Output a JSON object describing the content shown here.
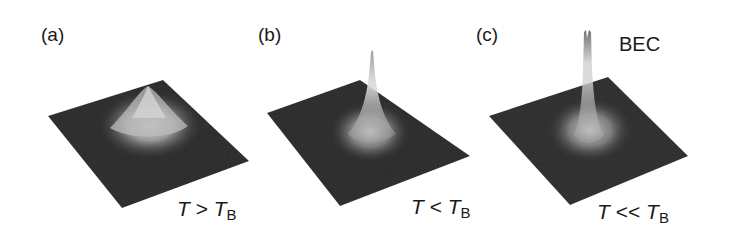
{
  "figure": {
    "panels": [
      {
        "label": "(a)",
        "condition": {
          "lhs": "T",
          "op": ">",
          "rhs": "T",
          "rhs_sub": "B"
        },
        "peak": "broad thermal distribution"
      },
      {
        "label": "(b)",
        "condition": {
          "lhs": "T",
          "op": "<",
          "rhs": "T",
          "rhs_sub": "B"
        },
        "peak": "narrow central peak emerging on thermal background"
      },
      {
        "label": "(c)",
        "condition": {
          "lhs": "T",
          "op": "<<",
          "rhs": "T",
          "rhs_sub": "B"
        },
        "annotation": "BEC",
        "peak": "tall sharp condensate peak"
      }
    ]
  },
  "colors": {
    "background": "#ffffff",
    "surface_dark": "#2e2e2e",
    "surface_mid": "#6a6a6a",
    "peak_light": "#d8d8d8",
    "text": "#1a1a1a"
  }
}
